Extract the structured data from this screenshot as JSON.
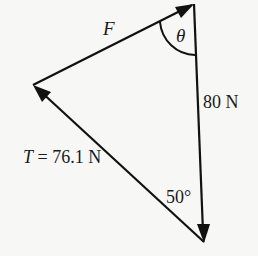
{
  "diagram": {
    "type": "force-triangle",
    "colors": {
      "background": "#f7f7f5",
      "stroke": "#111111",
      "text": "#1a1a1a"
    },
    "vertices": {
      "top": [
        194,
        4
      ],
      "left": [
        33,
        85
      ],
      "bottom": [
        204,
        242
      ]
    },
    "vectors": [
      {
        "name": "F",
        "from": "left",
        "to": "top",
        "label": "F"
      },
      {
        "name": "weight",
        "from": "top",
        "to": "bottom",
        "label": "80 N"
      },
      {
        "name": "T",
        "from": "bottom",
        "to": "left",
        "label": "T = 76.1 N"
      }
    ],
    "angles": [
      {
        "at": "top",
        "label": "θ"
      },
      {
        "at": "bottom",
        "label": "50°"
      }
    ]
  },
  "labels": {
    "F": "F",
    "theta": "θ",
    "weight": "80 N",
    "T_prefix": "T",
    "T_rest": " = 76.1 N",
    "angle_bottom": "50°"
  }
}
